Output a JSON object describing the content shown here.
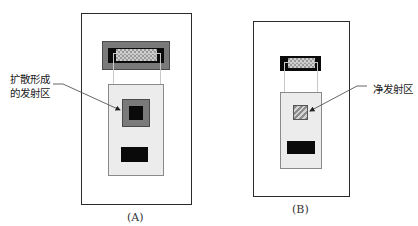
{
  "figure": {
    "panels": [
      {
        "id": "A",
        "caption": "(A)",
        "annotation": {
          "line1": "扩散形成",
          "line2": "的发射区"
        },
        "regions": [
          "outer-substrate",
          "top-contact-gray",
          "top-contact-black",
          "top-contact-checker",
          "base-region-light",
          "emitter-diffusion-gray",
          "emitter-contact-black",
          "bottom-contact-black"
        ]
      },
      {
        "id": "B",
        "caption": "(B)",
        "annotation": {
          "line1": "净发射区"
        },
        "regions": [
          "outer-substrate",
          "top-contact-black",
          "top-contact-checker",
          "base-region-light",
          "net-emitter-hatched",
          "bottom-contact-black"
        ]
      }
    ],
    "colors": {
      "outline": "#2a2a2a",
      "gray_fill": "#7a7a7a",
      "black_fill": "#0a0a0a",
      "light_fill": "#ececec",
      "leader_line": "#555555"
    }
  }
}
